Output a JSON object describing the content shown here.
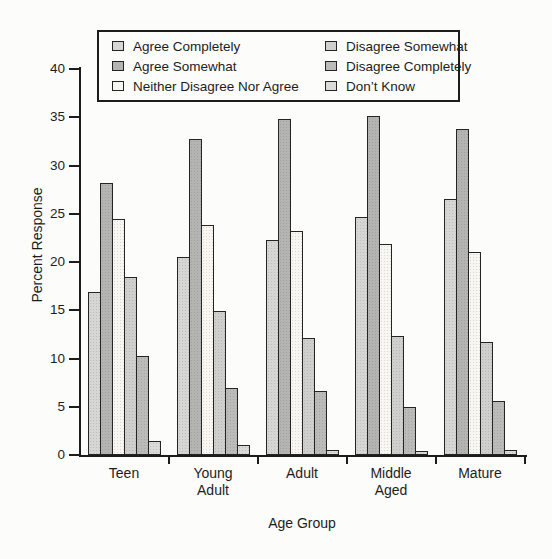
{
  "figure": {
    "background": "#fcfcfb",
    "axis_color": "#1c1c1c"
  },
  "chart_data": {
    "type": "bar",
    "title": "",
    "xlabel": "Age Group",
    "ylabel": "Percent Response",
    "ylim": [
      0,
      40
    ],
    "y_ticks": [
      0,
      5,
      10,
      15,
      20,
      25,
      30,
      35,
      40
    ],
    "grid": false,
    "legend_position": "top",
    "legend_columns": 2,
    "categories": [
      "Teen",
      "Young Adult",
      "Adult",
      "Middle Aged",
      "Mature"
    ],
    "series": [
      {
        "name": "Agree Completely",
        "color": "#d6d6d4",
        "values": [
          16.9,
          20.5,
          22.3,
          24.7,
          26.5
        ]
      },
      {
        "name": "Agree Somewhat",
        "color": "#b4b4b2",
        "values": [
          28.2,
          32.7,
          34.8,
          35.1,
          33.8
        ]
      },
      {
        "name": "Neither Disagree Nor Agree",
        "color": "#f7f6f1",
        "values": [
          24.5,
          23.8,
          23.2,
          21.9,
          21.0
        ]
      },
      {
        "name": "Disagree Somewhat",
        "color": "#cfcfcd",
        "values": [
          18.4,
          14.9,
          12.1,
          12.3,
          11.7
        ]
      },
      {
        "name": "Disagree Completely",
        "color": "#bbbbb9",
        "values": [
          10.3,
          6.9,
          6.6,
          5.0,
          5.6
        ]
      },
      {
        "name": "Don’t Know",
        "color": "#dadad8",
        "values": [
          1.4,
          1.0,
          0.5,
          0.4,
          0.5
        ]
      }
    ]
  }
}
